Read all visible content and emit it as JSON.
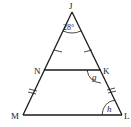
{
  "diagram": {
    "title": "",
    "vertices": {
      "J": {
        "label": "J",
        "x": 72,
        "y": 12
      },
      "N": {
        "label": "N",
        "x": 44,
        "y": 70
      },
      "K": {
        "label": "K",
        "x": 101,
        "y": 70
      },
      "M": {
        "label": "M",
        "x": 23,
        "y": 115
      },
      "L": {
        "label": "L",
        "x": 122,
        "y": 115
      }
    },
    "segments": [
      "JM",
      "JL",
      "ML",
      "NK"
    ],
    "tick_marks": {
      "JN": 1,
      "JK": 1,
      "NM": 2,
      "KL": 2
    },
    "angles": {
      "J": {
        "label": "28°"
      },
      "K": {
        "label": "g"
      },
      "L": {
        "label": "h"
      }
    },
    "colors": {
      "stroke": "#1a1a1a",
      "background": "#ffffff"
    }
  }
}
